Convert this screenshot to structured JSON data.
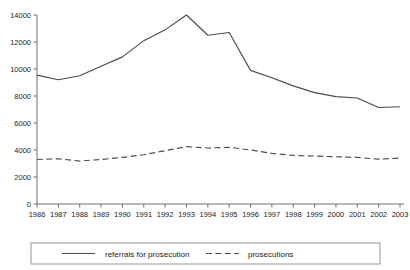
{
  "chart_data": {
    "type": "line",
    "title": "",
    "subtitle": "",
    "xlabel": "",
    "ylabel": "",
    "xlim": [
      1986,
      2003
    ],
    "ylim": [
      0,
      14000
    ],
    "grid": false,
    "legend_position": "bottom",
    "x": [
      1986,
      1987,
      1988,
      1989,
      1990,
      1991,
      1992,
      1993,
      1994,
      1995,
      1996,
      1997,
      1998,
      1999,
      2000,
      2001,
      2002,
      2003
    ],
    "xtick_labels": [
      "1986",
      "1987",
      "1988",
      "1989",
      "1990",
      "1991",
      "1992",
      "1993",
      "1994",
      "1995",
      "1996",
      "1997",
      "1998",
      "1999",
      "2000",
      "2001",
      "2002",
      "2003"
    ],
    "ytick_values": [
      0,
      2000,
      4000,
      6000,
      8000,
      10000,
      12000,
      14000
    ],
    "ytick_labels": [
      "0",
      "2000",
      "4000",
      "6000",
      "8000",
      "10000",
      "12000",
      "14000"
    ],
    "series": [
      {
        "name": "referrals for prosecution",
        "style": "solid",
        "color": "#4a4a52",
        "values": [
          9550,
          9200,
          9500,
          10200,
          10900,
          12100,
          12900,
          14000,
          12500,
          12700,
          9900,
          9350,
          8750,
          8250,
          7950,
          7850,
          7150,
          7200
        ]
      },
      {
        "name": "prosecutions",
        "style": "dashed",
        "color": "#4a4a52",
        "values": [
          3300,
          3350,
          3180,
          3300,
          3450,
          3650,
          3950,
          4250,
          4150,
          4200,
          4000,
          3750,
          3600,
          3550,
          3500,
          3450,
          3320,
          3400
        ]
      }
    ],
    "legend": [
      {
        "label": "referrals for prosecution",
        "style": "solid"
      },
      {
        "label": "prosecutions",
        "style": "dashed"
      }
    ]
  }
}
